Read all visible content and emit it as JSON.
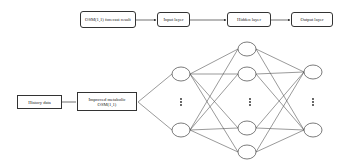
{
  "diagram": {
    "type": "neural-network-flow",
    "top_flow": [
      {
        "id": "osm_result",
        "label": "OSM(1,1) forecast result"
      },
      {
        "id": "input_layer",
        "label": "Input layer"
      },
      {
        "id": "hidden_layer",
        "label": "Hidden layer"
      },
      {
        "id": "output_layer",
        "label": "Output layer"
      }
    ],
    "bottom_flow": [
      {
        "id": "history",
        "label": "History data"
      },
      {
        "id": "improved_osm",
        "label": "Improved metabolic OSM(1,1)"
      }
    ],
    "network": {
      "input_nodes": 2,
      "hidden_nodes": 4,
      "output_nodes": 2,
      "ellipsis": "⋮",
      "fully_connected": true
    },
    "colors": {
      "line": "#444444",
      "node_fill": "#ffffff"
    }
  }
}
